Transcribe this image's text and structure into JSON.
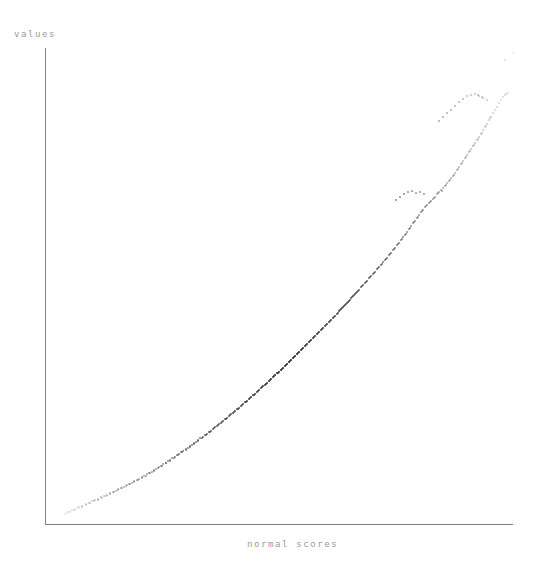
{
  "figure": {
    "background_color": "#ffffff",
    "axis_color": "#808080",
    "label_color": "#9a9a9a",
    "point_color": "#3a3a3a"
  },
  "labels": {
    "ylabel": "values",
    "xlabel": "normal scores"
  },
  "axes": {
    "y_axis": {
      "x": 45,
      "y_top": 48,
      "y_bottom": 524
    },
    "x_axis": {
      "y": 524,
      "x_left": 45,
      "x_right": 513
    }
  },
  "chart_data": {
    "type": "scatter",
    "title": "",
    "subtitle": "",
    "xlabel": "normal scores",
    "ylabel": "values",
    "grid": false,
    "legend": null,
    "axis_ticks": {
      "x": [],
      "y": []
    },
    "xlim": [
      45,
      513
    ],
    "ylim": [
      48,
      524
    ],
    "note": "Normal quantile-quantile plot: sample quantiles versus normal scores, monotone increasing with convex curvature and sparse tails.",
    "points": [
      [
        65,
        514
      ],
      [
        68,
        512
      ],
      [
        72,
        510
      ],
      [
        75,
        509
      ],
      [
        79,
        507
      ],
      [
        82,
        506
      ],
      [
        86,
        504
      ],
      [
        89,
        503
      ],
      [
        92,
        501
      ],
      [
        95,
        500
      ],
      [
        98,
        499
      ],
      [
        101,
        497
      ],
      [
        104,
        496
      ],
      [
        107,
        495
      ],
      [
        110,
        493
      ],
      [
        113,
        492
      ],
      [
        116,
        491
      ],
      [
        118,
        489
      ],
      [
        121,
        488
      ],
      [
        124,
        487
      ],
      [
        127,
        485
      ],
      [
        129,
        484
      ],
      [
        132,
        483
      ],
      [
        134,
        481
      ],
      [
        137,
        480
      ],
      [
        139,
        479
      ],
      [
        142,
        477
      ],
      [
        144,
        476
      ],
      [
        147,
        474
      ],
      [
        149,
        473
      ],
      [
        152,
        472
      ],
      [
        154,
        470
      ],
      [
        156,
        469
      ],
      [
        159,
        467
      ],
      [
        161,
        466
      ],
      [
        163,
        464
      ],
      [
        166,
        463
      ],
      [
        168,
        461
      ],
      [
        170,
        460
      ],
      [
        172,
        458
      ],
      [
        175,
        457
      ],
      [
        177,
        455
      ],
      [
        179,
        454
      ],
      [
        181,
        452
      ],
      [
        183,
        451
      ],
      [
        186,
        449
      ],
      [
        188,
        448
      ],
      [
        190,
        446
      ],
      [
        192,
        445
      ],
      [
        194,
        443
      ],
      [
        196,
        442
      ],
      [
        198,
        440
      ],
      [
        200,
        438
      ],
      [
        203,
        437
      ],
      [
        205,
        435
      ],
      [
        207,
        434
      ],
      [
        209,
        432
      ],
      [
        211,
        431
      ],
      [
        213,
        429
      ],
      [
        215,
        427
      ],
      [
        217,
        426
      ],
      [
        219,
        424
      ],
      [
        221,
        423
      ],
      [
        223,
        421
      ],
      [
        225,
        419
      ],
      [
        227,
        418
      ],
      [
        229,
        416
      ],
      [
        231,
        414
      ],
      [
        233,
        413
      ],
      [
        235,
        411
      ],
      [
        237,
        409
      ],
      [
        239,
        408
      ],
      [
        241,
        406
      ],
      [
        243,
        404
      ],
      [
        245,
        402
      ],
      [
        247,
        401
      ],
      [
        249,
        399
      ],
      [
        251,
        397
      ],
      [
        253,
        395
      ],
      [
        255,
        394
      ],
      [
        257,
        392
      ],
      [
        259,
        390
      ],
      [
        261,
        388
      ],
      [
        263,
        386
      ],
      [
        265,
        385
      ],
      [
        267,
        383
      ],
      [
        269,
        381
      ],
      [
        271,
        379
      ],
      [
        273,
        377
      ],
      [
        275,
        375
      ],
      [
        277,
        373
      ],
      [
        279,
        372
      ],
      [
        281,
        370
      ],
      [
        283,
        368
      ],
      [
        285,
        366
      ],
      [
        287,
        364
      ],
      [
        289,
        362
      ],
      [
        291,
        360
      ],
      [
        293,
        358
      ],
      [
        295,
        356
      ],
      [
        297,
        354
      ],
      [
        299,
        352
      ],
      [
        301,
        350
      ],
      [
        303,
        348
      ],
      [
        305,
        346
      ],
      [
        307,
        344
      ],
      [
        309,
        342
      ],
      [
        311,
        340
      ],
      [
        313,
        338
      ],
      [
        315,
        336
      ],
      [
        317,
        334
      ],
      [
        319,
        332
      ],
      [
        321,
        330
      ],
      [
        323,
        328
      ],
      [
        325,
        326
      ],
      [
        327,
        324
      ],
      [
        329,
        322
      ],
      [
        331,
        320
      ],
      [
        333,
        318
      ],
      [
        335,
        316
      ],
      [
        337,
        314
      ],
      [
        339,
        311
      ],
      [
        341,
        309
      ],
      [
        343,
        307
      ],
      [
        345,
        305
      ],
      [
        347,
        303
      ],
      [
        349,
        301
      ],
      [
        351,
        298
      ],
      [
        353,
        296
      ],
      [
        355,
        294
      ],
      [
        357,
        292
      ],
      [
        359,
        290
      ],
      [
        361,
        287
      ],
      [
        363,
        285
      ],
      [
        365,
        283
      ],
      [
        367,
        281
      ],
      [
        369,
        278
      ],
      [
        371,
        276
      ],
      [
        373,
        274
      ],
      [
        375,
        272
      ],
      [
        377,
        269
      ],
      [
        379,
        267
      ],
      [
        381,
        265
      ],
      [
        383,
        262
      ],
      [
        385,
        260
      ],
      [
        387,
        258
      ],
      [
        389,
        255
      ],
      [
        391,
        253
      ],
      [
        393,
        250
      ],
      [
        395,
        248
      ],
      [
        397,
        245
      ],
      [
        399,
        243
      ],
      [
        401,
        240
      ],
      [
        403,
        237
      ],
      [
        405,
        235
      ],
      [
        407,
        232
      ],
      [
        409,
        229
      ],
      [
        411,
        226
      ],
      [
        413,
        223
      ],
      [
        415,
        221
      ],
      [
        417,
        218
      ],
      [
        419,
        215
      ],
      [
        421,
        212
      ],
      [
        423,
        210
      ],
      [
        425,
        207
      ],
      [
        427,
        205
      ],
      [
        429,
        203
      ],
      [
        431,
        201
      ],
      [
        433,
        199
      ],
      [
        435,
        197
      ],
      [
        437,
        194
      ],
      [
        439,
        192
      ],
      [
        441,
        190
      ],
      [
        443,
        188
      ],
      [
        445,
        186
      ],
      [
        447,
        183
      ],
      [
        449,
        181
      ],
      [
        451,
        178
      ],
      [
        453,
        176
      ],
      [
        455,
        173
      ],
      [
        457,
        170
      ],
      [
        459,
        167
      ],
      [
        461,
        164
      ],
      [
        463,
        161
      ],
      [
        465,
        158
      ],
      [
        467,
        155
      ],
      [
        469,
        152
      ],
      [
        471,
        149
      ],
      [
        473,
        146
      ],
      [
        475,
        143
      ],
      [
        477,
        140
      ],
      [
        479,
        137
      ],
      [
        481,
        134
      ],
      [
        483,
        130
      ],
      [
        485,
        127
      ],
      [
        487,
        124
      ],
      [
        489,
        120
      ],
      [
        491,
        117
      ],
      [
        493,
        113
      ],
      [
        495,
        110
      ],
      [
        497,
        107
      ],
      [
        499,
        103
      ],
      [
        501,
        100
      ],
      [
        503,
        97
      ],
      [
        505,
        95
      ],
      [
        490,
        118
      ],
      [
        486,
        126
      ],
      [
        482,
        133
      ],
      [
        478,
        139
      ],
      [
        474,
        145
      ],
      [
        470,
        151
      ],
      [
        466,
        157
      ],
      [
        462,
        163
      ],
      [
        458,
        169
      ],
      [
        454,
        175
      ],
      [
        450,
        180
      ],
      [
        446,
        185
      ],
      [
        442,
        191
      ],
      [
        438,
        193
      ],
      [
        434,
        198
      ],
      [
        430,
        202
      ],
      [
        426,
        206
      ],
      [
        422,
        211
      ],
      [
        418,
        217
      ],
      [
        414,
        222
      ],
      [
        410,
        228
      ],
      [
        406,
        234
      ],
      [
        402,
        239
      ],
      [
        398,
        244
      ],
      [
        394,
        249
      ],
      [
        390,
        254
      ],
      [
        386,
        259
      ],
      [
        382,
        264
      ],
      [
        378,
        268
      ],
      [
        374,
        273
      ],
      [
        370,
        277
      ],
      [
        366,
        282
      ],
      [
        362,
        286
      ],
      [
        358,
        291
      ],
      [
        354,
        295
      ],
      [
        350,
        300
      ],
      [
        346,
        304
      ],
      [
        342,
        308
      ],
      [
        338,
        313
      ],
      [
        334,
        317
      ],
      [
        330,
        321
      ],
      [
        326,
        325
      ],
      [
        322,
        329
      ],
      [
        318,
        333
      ],
      [
        314,
        337
      ],
      [
        310,
        341
      ],
      [
        306,
        345
      ],
      [
        302,
        349
      ],
      [
        298,
        353
      ],
      [
        294,
        357
      ],
      [
        290,
        361
      ],
      [
        286,
        365
      ],
      [
        282,
        369
      ],
      [
        278,
        373
      ],
      [
        274,
        376
      ],
      [
        270,
        380
      ],
      [
        266,
        384
      ],
      [
        262,
        387
      ],
      [
        258,
        391
      ],
      [
        254,
        395
      ],
      [
        250,
        398
      ],
      [
        246,
        402
      ],
      [
        242,
        405
      ],
      [
        238,
        409
      ],
      [
        234,
        412
      ],
      [
        230,
        415
      ],
      [
        226,
        419
      ],
      [
        222,
        422
      ],
      [
        218,
        425
      ],
      [
        214,
        428
      ],
      [
        210,
        432
      ],
      [
        206,
        435
      ],
      [
        202,
        438
      ],
      [
        198,
        441
      ],
      [
        194,
        444
      ],
      [
        190,
        447
      ],
      [
        186,
        450
      ],
      [
        182,
        452
      ],
      [
        178,
        455
      ],
      [
        174,
        458
      ],
      [
        170,
        461
      ],
      [
        166,
        463
      ],
      [
        162,
        466
      ],
      [
        158,
        468
      ],
      [
        154,
        471
      ],
      [
        150,
        473
      ],
      [
        146,
        476
      ],
      [
        142,
        478
      ],
      [
        138,
        480
      ],
      [
        134,
        482
      ],
      [
        130,
        484
      ],
      [
        126,
        486
      ],
      [
        122,
        488
      ],
      [
        118,
        490
      ],
      [
        114,
        492
      ],
      [
        110,
        494
      ],
      [
        106,
        496
      ],
      [
        102,
        498
      ],
      [
        98,
        500
      ],
      [
        94,
        501
      ],
      [
        90,
        503
      ],
      [
        86,
        505
      ],
      [
        82,
        507
      ],
      [
        78,
        508
      ],
      [
        74,
        510
      ],
      [
        70,
        512
      ],
      [
        66,
        513
      ],
      [
        467,
        96
      ],
      [
        471,
        95
      ],
      [
        475,
        94
      ],
      [
        479,
        96
      ],
      [
        483,
        98
      ],
      [
        487,
        100
      ],
      [
        478,
        95
      ],
      [
        482,
        97
      ],
      [
        463,
        99
      ],
      [
        459,
        102
      ],
      [
        455,
        106
      ],
      [
        451,
        110
      ],
      [
        447,
        113
      ],
      [
        443,
        117
      ],
      [
        439,
        121
      ],
      [
        508,
        93
      ],
      [
        506,
        94
      ],
      [
        513,
        53
      ],
      [
        505,
        60
      ],
      [
        408,
        192
      ],
      [
        412,
        191
      ],
      [
        416,
        193
      ],
      [
        420,
        192
      ],
      [
        424,
        194
      ],
      [
        404,
        194
      ],
      [
        400,
        197
      ],
      [
        396,
        200
      ],
      [
        356,
        293
      ],
      [
        352,
        297
      ],
      [
        348,
        302
      ],
      [
        344,
        306
      ],
      [
        340,
        310
      ]
    ]
  }
}
